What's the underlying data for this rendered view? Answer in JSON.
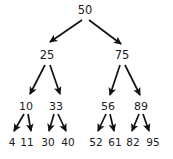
{
  "figure": {
    "type": "binary-search-tree-diagram",
    "background_color": "#ffffff",
    "text_color": "#1a1a1a",
    "edge_color": "#111111"
  },
  "tree": {
    "levels": [
      {
        "name": "root",
        "nodes": [
          {
            "value": "50",
            "x": 85,
            "y": 5
          }
        ]
      },
      {
        "name": "level-1",
        "nodes": [
          {
            "value": "25",
            "x": 47,
            "y": 50
          },
          {
            "value": "75",
            "x": 122,
            "y": 50
          }
        ]
      },
      {
        "name": "level-2",
        "nodes": [
          {
            "value": "10",
            "x": 26,
            "y": 101
          },
          {
            "value": "33",
            "x": 56,
            "y": 101
          },
          {
            "value": "56",
            "x": 108,
            "y": 101
          },
          {
            "value": "89",
            "x": 141,
            "y": 101
          }
        ]
      },
      {
        "name": "level-3",
        "nodes": [
          {
            "value": "4",
            "x": 12,
            "y": 137
          },
          {
            "value": "11",
            "x": 27,
            "y": 137
          },
          {
            "value": "30",
            "x": 48,
            "y": 137
          },
          {
            "value": "40",
            "x": 68,
            "y": 137
          },
          {
            "value": "52",
            "x": 96,
            "y": 137
          },
          {
            "value": "61",
            "x": 115,
            "y": 137
          },
          {
            "value": "82",
            "x": 133,
            "y": 137
          },
          {
            "value": "95",
            "x": 153,
            "y": 137
          }
        ]
      }
    ],
    "edges": [
      {
        "from": "50",
        "to": "25",
        "x1": 82,
        "y1": 20,
        "x2": 50,
        "y2": 42
      },
      {
        "from": "50",
        "to": "75",
        "x1": 89,
        "y1": 20,
        "x2": 121,
        "y2": 44
      },
      {
        "from": "25",
        "to": "10",
        "x1": 45,
        "y1": 65,
        "x2": 30,
        "y2": 94
      },
      {
        "from": "25",
        "to": "33",
        "x1": 50,
        "y1": 65,
        "x2": 60,
        "y2": 94
      },
      {
        "from": "75",
        "to": "56",
        "x1": 120,
        "y1": 65,
        "x2": 110,
        "y2": 95
      },
      {
        "from": "75",
        "to": "89",
        "x1": 125,
        "y1": 65,
        "x2": 140,
        "y2": 95
      },
      {
        "from": "10",
        "to": "4",
        "x1": 24,
        "y1": 114,
        "x2": 14,
        "y2": 131
      },
      {
        "from": "10",
        "to": "11",
        "x1": 28,
        "y1": 114,
        "x2": 31,
        "y2": 131
      },
      {
        "from": "33",
        "to": "30",
        "x1": 54,
        "y1": 114,
        "x2": 49,
        "y2": 131
      },
      {
        "from": "33",
        "to": "40",
        "x1": 58,
        "y1": 114,
        "x2": 66,
        "y2": 131
      },
      {
        "from": "56",
        "to": "52",
        "x1": 106,
        "y1": 114,
        "x2": 98,
        "y2": 131
      },
      {
        "from": "56",
        "to": "61",
        "x1": 110,
        "y1": 114,
        "x2": 114,
        "y2": 131
      },
      {
        "from": "89",
        "to": "82",
        "x1": 139,
        "y1": 114,
        "x2": 132,
        "y2": 131
      },
      {
        "from": "89",
        "to": "95",
        "x1": 143,
        "y1": 114,
        "x2": 149,
        "y2": 131
      }
    ]
  }
}
